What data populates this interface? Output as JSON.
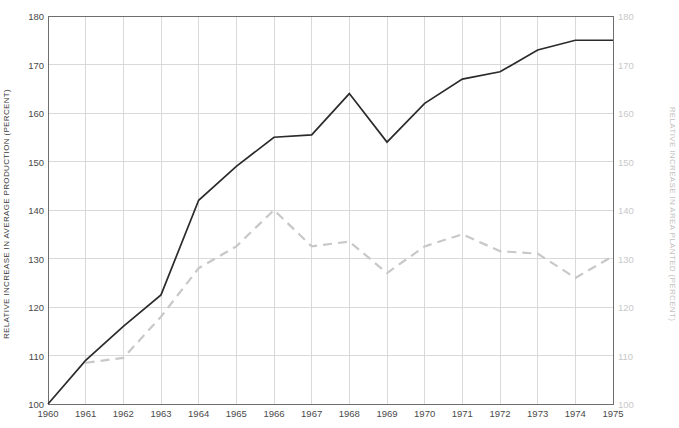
{
  "chart_data": {
    "type": "line",
    "title": "",
    "xlabel": "",
    "ylabel": "RELATIVE INCREASE IN AVERAGE PRODUCTION (PERCENT)",
    "y2label": "RELATIVE INCREASE IN AREA PLANTED (PERCENT)",
    "x": [
      1960,
      1961,
      1962,
      1963,
      1964,
      1965,
      1966,
      1967,
      1968,
      1969,
      1970,
      1971,
      1972,
      1973,
      1974,
      1975
    ],
    "categories": [
      "1960",
      "1961",
      "1962",
      "1963",
      "1964",
      "1965",
      "1966",
      "1967",
      "1968",
      "1969",
      "1970",
      "1971",
      "1972",
      "1973",
      "1974",
      "1975"
    ],
    "xlim": [
      1960,
      1975
    ],
    "ylim": [
      100,
      180
    ],
    "y2lim": [
      100,
      180
    ],
    "yticks": [
      100,
      110,
      120,
      130,
      140,
      150,
      160,
      170,
      180
    ],
    "y2ticks": [
      100,
      110,
      120,
      130,
      140,
      150,
      160,
      170,
      180
    ],
    "ytick_labels": [
      "100",
      "110",
      "120",
      "130",
      "140",
      "150",
      "160",
      "170",
      "180"
    ],
    "y2tick_labels": [
      "100",
      "110",
      "120",
      "130",
      "140",
      "150",
      "160",
      "170",
      "180"
    ],
    "grid": true,
    "legend": "none",
    "series": [
      {
        "name": "Relative increase in average production",
        "axis": "left",
        "style": "solid",
        "color": "#2b2b2b",
        "x": [
          1960,
          1961,
          1962,
          1963,
          1964,
          1965,
          1966,
          1967,
          1968,
          1969,
          1970,
          1971,
          1972,
          1973,
          1974,
          1975
        ],
        "values": [
          100,
          109,
          116,
          122.5,
          142,
          149,
          155,
          155.5,
          164,
          154,
          162,
          167,
          168.5,
          173,
          175,
          175
        ]
      },
      {
        "name": "Relative increase in area planted",
        "axis": "right",
        "style": "dashed",
        "color": "#c8c8c8",
        "x": [
          1961,
          1962,
          1963,
          1964,
          1965,
          1966,
          1967,
          1968,
          1969,
          1970,
          1971,
          1972,
          1973,
          1974,
          1975
        ],
        "values": [
          108.5,
          109.5,
          118,
          128,
          132.5,
          140,
          132.5,
          133.5,
          127,
          132.5,
          135,
          131.5,
          131,
          126,
          130.5
        ]
      }
    ]
  },
  "axes": {
    "left_title": "RELATIVE INCREASE IN AVERAGE PRODUCTION (PERCENT)",
    "right_title": "RELATIVE INCREASE IN AREA PLANTED (PERCENT)"
  },
  "colors": {
    "production_line": "#2b2b2b",
    "area_line": "#c8c8c8",
    "grid": "#d9d9d9",
    "frame": "#6e6e6e",
    "left_text": "#3b3b3b",
    "right_text": "#c2c2c2"
  }
}
